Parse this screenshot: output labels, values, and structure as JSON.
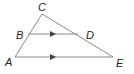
{
  "diagram": {
    "type": "geometry-triangle",
    "points": {
      "A": {
        "label": "A",
        "x": 15,
        "y": 57,
        "label_x": 5,
        "label_y": 66
      },
      "B": {
        "label": "B",
        "x": 28,
        "y": 34,
        "label_x": 16,
        "label_y": 39
      },
      "C": {
        "label": "C",
        "x": 42,
        "y": 14,
        "label_x": 38,
        "label_y": 11
      },
      "D": {
        "label": "D",
        "x": 78,
        "y": 34,
        "label_x": 86,
        "label_y": 39
      },
      "E": {
        "label": "E",
        "x": 113,
        "y": 57,
        "label_x": 116,
        "label_y": 67
      }
    },
    "segments": [
      {
        "from": "A",
        "to": "C"
      },
      {
        "from": "C",
        "to": "E"
      },
      {
        "from": "A",
        "to": "E"
      },
      {
        "from": "B",
        "to": "D"
      }
    ],
    "parallel_marks": [
      {
        "segment": "BD",
        "x": 53,
        "y": 34
      },
      {
        "segment": "AE",
        "x": 53,
        "y": 57
      }
    ],
    "colors": {
      "line": "#8a8a8a",
      "arrow": "#444444",
      "label": "#222222"
    }
  }
}
